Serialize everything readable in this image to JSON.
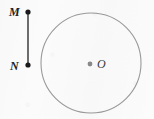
{
  "figure": {
    "canvas": {
      "width": 154,
      "height": 119,
      "background": "#fbfbfb"
    },
    "circle": {
      "name": "circle",
      "center_x": 91,
      "center_y": 63,
      "radius": 50,
      "stroke_color": "#9a9a9a",
      "stroke_width": 1.1,
      "fill": "none"
    },
    "center_point": {
      "label": "O",
      "dot_x": 90,
      "dot_y": 64,
      "dot_radius": 2.4,
      "dot_color": "#8a8a8a",
      "label_x": 97,
      "label_y": 68,
      "label_color": "#3a3a3a"
    },
    "segment": {
      "name": "segment-MN",
      "x": 28,
      "y_start": 12,
      "y_end": 65,
      "stroke_color": "#1f1f1f",
      "stroke_width": 1.3
    },
    "points": [
      {
        "label": "M",
        "dot_x": 28,
        "dot_y": 12,
        "dot_radius": 2.6,
        "dot_color": "#1a1a1a",
        "label_x": 9,
        "label_y": 16,
        "label_color": "#1f1f1f"
      },
      {
        "label": "N",
        "dot_x": 28,
        "dot_y": 65,
        "dot_radius": 2.6,
        "dot_color": "#1a1a1a",
        "label_x": 10,
        "label_y": 70,
        "label_color": "#1f1f1f"
      }
    ]
  }
}
